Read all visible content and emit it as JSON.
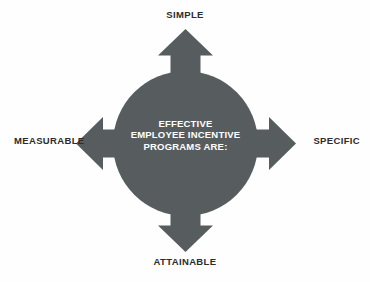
{
  "diagram": {
    "type": "four-direction-arrow-circle",
    "title_lines": [
      "EFFECTIVE",
      "EMPLOYEE INCENTIVE",
      "PROGRAMS ARE:"
    ],
    "center_text_color": "#ffffff",
    "shape_color": "#575d5e",
    "background_color": "#fefefe",
    "label_color": "#2c2c2c",
    "labels": {
      "top": "SIMPLE",
      "right": "SPECIFIC",
      "bottom": "ATTAINABLE",
      "left": "MEASURABLE"
    },
    "arrows": [
      {
        "direction": "up",
        "name": "arrow-up",
        "points_to": "SIMPLE"
      },
      {
        "direction": "right",
        "name": "arrow-right",
        "points_to": "SPECIFIC"
      },
      {
        "direction": "down",
        "name": "arrow-down",
        "points_to": "ATTAINABLE"
      },
      {
        "direction": "left",
        "name": "arrow-left",
        "points_to": "MEASURABLE"
      }
    ]
  }
}
